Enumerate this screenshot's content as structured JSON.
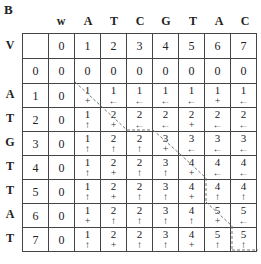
{
  "figure_label": "B",
  "col_seq_label": "w",
  "row_seq_label": "V",
  "col_letters": [
    "A",
    "T",
    "C",
    "G",
    "T",
    "A",
    "C"
  ],
  "row_letters": [
    "A",
    "T",
    "G",
    "T",
    "T",
    "A",
    "T"
  ],
  "index_row": [
    "",
    "0",
    "1",
    "2",
    "3",
    "4",
    "5",
    "6",
    "7"
  ],
  "zero_row": [
    "0",
    "0",
    "0",
    "0",
    "0",
    "0",
    "0",
    "0",
    "0"
  ],
  "arrow_glyphs": {
    "diag": "+",
    "left": "←",
    "up": "↑"
  },
  "rows": [
    {
      "index": "1",
      "first": "0",
      "cells": [
        [
          "1",
          "diag"
        ],
        [
          "1",
          "left"
        ],
        [
          "1",
          "left"
        ],
        [
          "1",
          "left"
        ],
        [
          "1",
          "left"
        ],
        [
          "1",
          "diag"
        ],
        [
          "1",
          "left"
        ]
      ]
    },
    {
      "index": "2",
      "first": "0",
      "cells": [
        [
          "1",
          "up"
        ],
        [
          "2",
          "diag"
        ],
        [
          "2",
          "left"
        ],
        [
          "2",
          "left"
        ],
        [
          "2",
          "diag"
        ],
        [
          "2",
          "left"
        ],
        [
          "2",
          "left"
        ]
      ]
    },
    {
      "index": "3",
      "first": "0",
      "cells": [
        [
          "1",
          "up"
        ],
        [
          "2",
          "up"
        ],
        [
          "2",
          "up"
        ],
        [
          "3",
          "diag"
        ],
        [
          "3",
          "left"
        ],
        [
          "3",
          "left"
        ],
        [
          "3",
          "left"
        ]
      ]
    },
    {
      "index": "4",
      "first": "0",
      "cells": [
        [
          "1",
          "up"
        ],
        [
          "2",
          "diag"
        ],
        [
          "2",
          "up"
        ],
        [
          "3",
          "up"
        ],
        [
          "4",
          "diag"
        ],
        [
          "4",
          "left"
        ],
        [
          "4",
          "left"
        ]
      ]
    },
    {
      "index": "5",
      "first": "0",
      "cells": [
        [
          "1",
          "up"
        ],
        [
          "2",
          "diag"
        ],
        [
          "2",
          "up"
        ],
        [
          "3",
          "up"
        ],
        [
          "4",
          "diag"
        ],
        [
          "4",
          "up"
        ],
        [
          "4",
          "up"
        ]
      ]
    },
    {
      "index": "6",
      "first": "0",
      "cells": [
        [
          "1",
          "diag"
        ],
        [
          "2",
          "up"
        ],
        [
          "2",
          "up"
        ],
        [
          "3",
          "up"
        ],
        [
          "4",
          "up"
        ],
        [
          "5",
          "diag"
        ],
        [
          "5",
          "left"
        ]
      ]
    },
    {
      "index": "7",
      "first": "0",
      "cells": [
        [
          "1",
          "up"
        ],
        [
          "2",
          "diag"
        ],
        [
          "2",
          "up"
        ],
        [
          "3",
          "up"
        ],
        [
          "4",
          "diag"
        ],
        [
          "5",
          "up"
        ],
        [
          "5",
          "up"
        ]
      ]
    }
  ],
  "path_color": "#777777"
}
